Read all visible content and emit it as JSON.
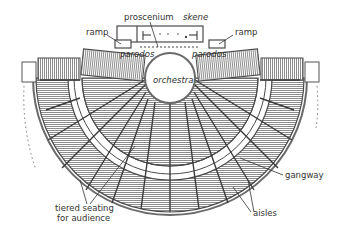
{
  "diagram": {
    "labels": {
      "proscenium": "proscenium",
      "skene": "skene",
      "ramp_left": "ramp",
      "ramp_right": "ramp",
      "parodos_left": "parodos",
      "parodos_right": "parodos",
      "orchestra": "orchestra",
      "gangway": "gangway",
      "aisles": "aisles",
      "seating_line1": "tiered seating",
      "seating_line2": "for audience"
    },
    "colors": {
      "line": "#4a4a4a",
      "hatch": "#8c8c8c",
      "text": "#333333",
      "background": "#ffffff"
    }
  }
}
